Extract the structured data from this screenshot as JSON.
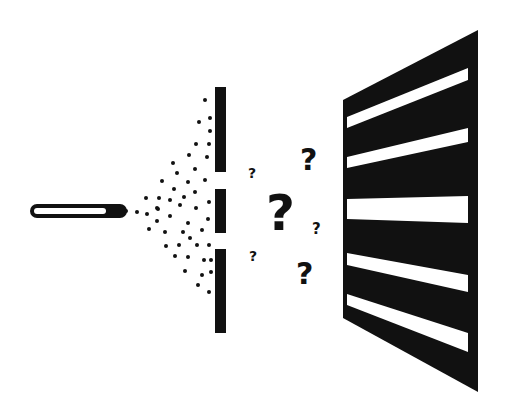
{
  "colors": {
    "ink": "#111111",
    "background": "#ffffff",
    "stripe": "#ffffff"
  },
  "emitter": {
    "label": "particle-source"
  },
  "barrier": {
    "slit_count": 2
  },
  "particle_count": 50,
  "question_marks": [
    "?",
    "?",
    "?",
    "?",
    "?",
    "?"
  ],
  "screen": {
    "bright_band_count": 5
  }
}
